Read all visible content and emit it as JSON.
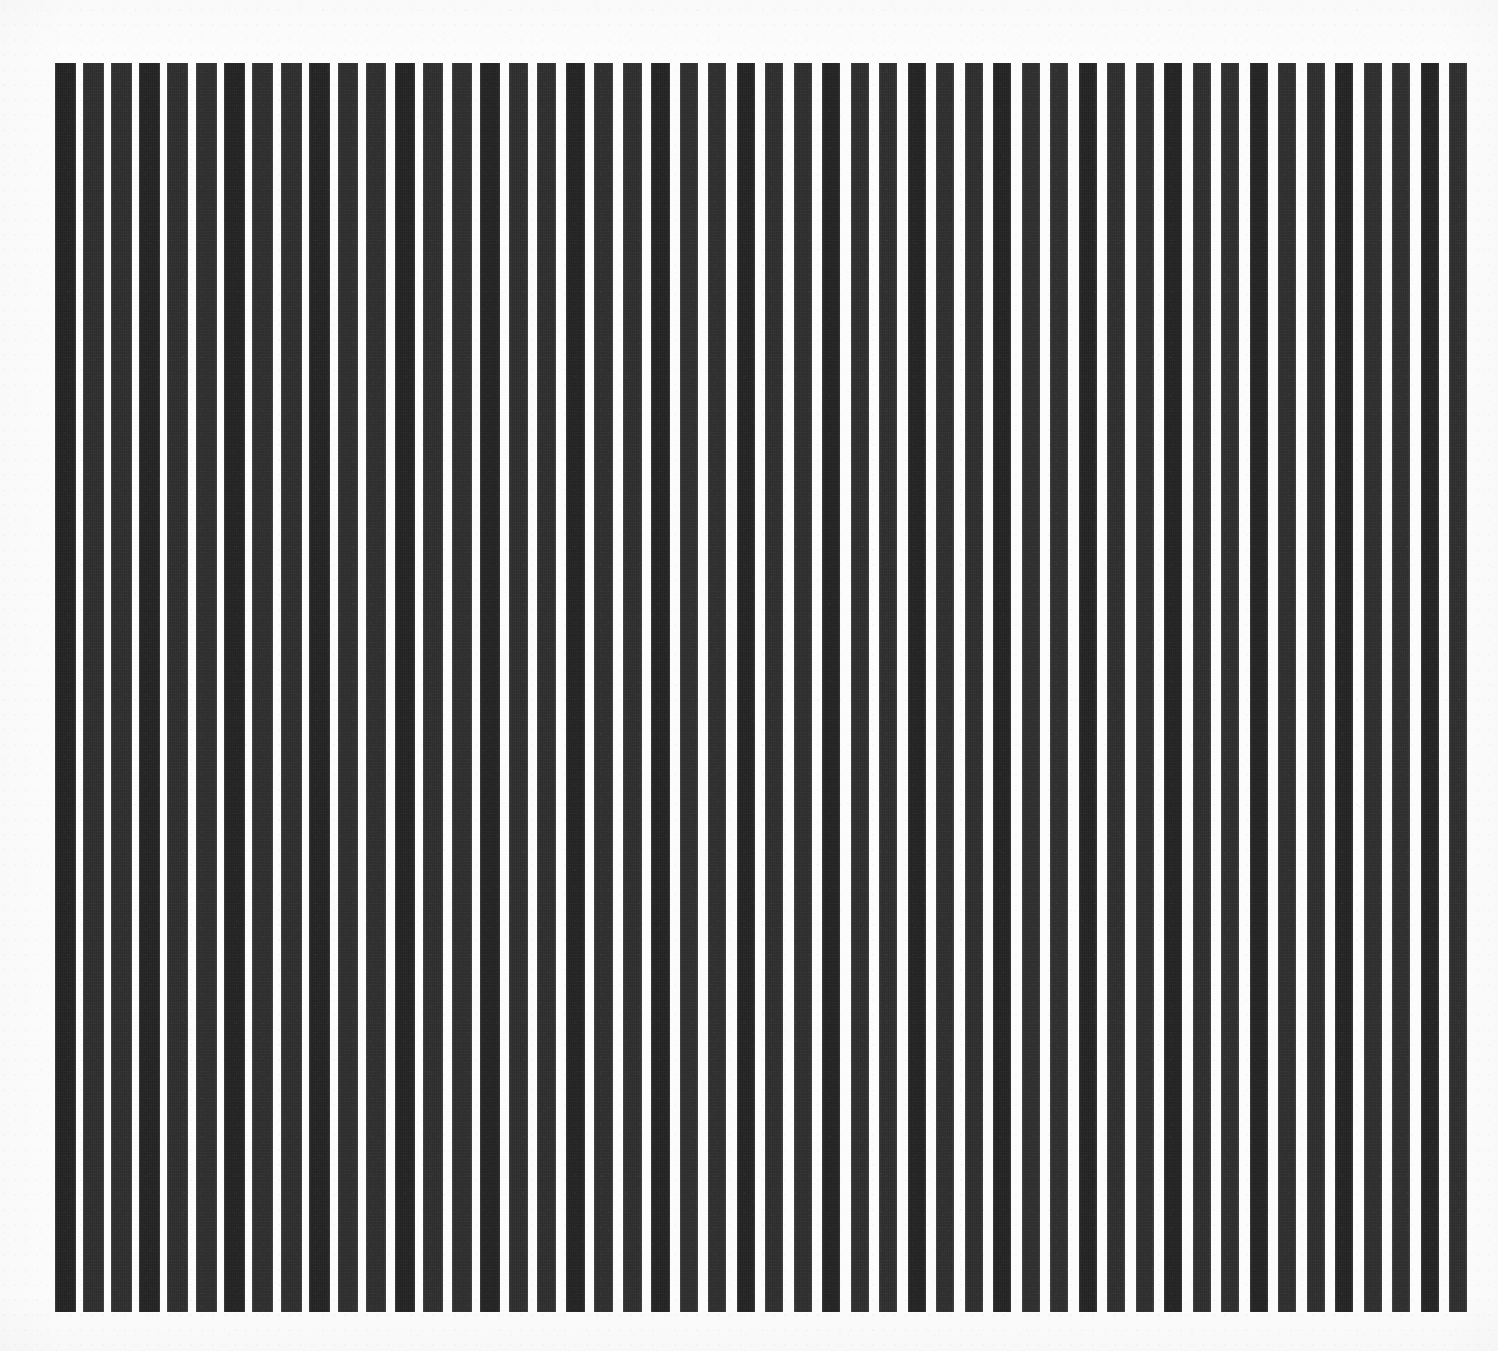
{
  "artwork": {
    "kind": "op-art-vertical-stripe-composition",
    "medium_appearance": "screenprint on white paper",
    "canvas_width": 1498,
    "canvas_height": 1351,
    "alt_text": "Op art composition of fifty vertical dark charcoal bars of slightly varying width and spacing on an off-white paper ground.",
    "colors": {
      "paper": "#fcfcfc",
      "page_background": "#ffffff",
      "ink": "#2f2f2f",
      "ink_shadow": "#242424"
    },
    "plate": {
      "left": 55,
      "top": 63,
      "right": 1478,
      "bottom": 1312,
      "width": 1423,
      "height": 1249
    },
    "stripe_count": 50,
    "stripe_metrics": {
      "min_width": 16,
      "max_width": 22,
      "min_gap": 6,
      "max_gap": 12,
      "mean_period": 28.5,
      "orientation": "vertical"
    },
    "stripes": [
      {
        "x": 55,
        "w": 21
      },
      {
        "x": 83,
        "w": 21
      },
      {
        "x": 111,
        "w": 21
      },
      {
        "x": 139,
        "w": 21
      },
      {
        "x": 167,
        "w": 21
      },
      {
        "x": 196,
        "w": 21
      },
      {
        "x": 224,
        "w": 21
      },
      {
        "x": 252,
        "w": 21
      },
      {
        "x": 281,
        "w": 21
      },
      {
        "x": 309,
        "w": 21
      },
      {
        "x": 338,
        "w": 20
      },
      {
        "x": 366,
        "w": 20
      },
      {
        "x": 395,
        "w": 20
      },
      {
        "x": 423,
        "w": 20
      },
      {
        "x": 452,
        "w": 20
      },
      {
        "x": 480,
        "w": 20
      },
      {
        "x": 509,
        "w": 19
      },
      {
        "x": 537,
        "w": 19
      },
      {
        "x": 566,
        "w": 19
      },
      {
        "x": 594,
        "w": 19
      },
      {
        "x": 623,
        "w": 19
      },
      {
        "x": 651,
        "w": 19
      },
      {
        "x": 680,
        "w": 18
      },
      {
        "x": 708,
        "w": 18
      },
      {
        "x": 737,
        "w": 18
      },
      {
        "x": 765,
        "w": 18
      },
      {
        "x": 794,
        "w": 18
      },
      {
        "x": 822,
        "w": 18
      },
      {
        "x": 851,
        "w": 18
      },
      {
        "x": 879,
        "w": 18
      },
      {
        "x": 908,
        "w": 18
      },
      {
        "x": 936,
        "w": 18
      },
      {
        "x": 965,
        "w": 18
      },
      {
        "x": 993,
        "w": 18
      },
      {
        "x": 1022,
        "w": 18
      },
      {
        "x": 1050,
        "w": 18
      },
      {
        "x": 1079,
        "w": 18
      },
      {
        "x": 1107,
        "w": 18
      },
      {
        "x": 1136,
        "w": 18
      },
      {
        "x": 1164,
        "w": 18
      },
      {
        "x": 1193,
        "w": 18
      },
      {
        "x": 1221,
        "w": 18
      },
      {
        "x": 1250,
        "w": 18
      },
      {
        "x": 1278,
        "w": 18
      },
      {
        "x": 1307,
        "w": 18
      },
      {
        "x": 1335,
        "w": 18
      },
      {
        "x": 1364,
        "w": 18
      },
      {
        "x": 1392,
        "w": 18
      },
      {
        "x": 1421,
        "w": 18
      },
      {
        "x": 1449,
        "w": 18
      }
    ]
  },
  "chart_data": {
    "type": "bar",
    "title": "",
    "subtitle": "",
    "xlabel": "",
    "ylabel": "",
    "grid": false,
    "legend": null,
    "orientation": "vertical",
    "categories": [
      "1",
      "2",
      "3",
      "4",
      "5",
      "6",
      "7",
      "8",
      "9",
      "10",
      "11",
      "12",
      "13",
      "14",
      "15",
      "16",
      "17",
      "18",
      "19",
      "20",
      "21",
      "22",
      "23",
      "24",
      "25",
      "26",
      "27",
      "28",
      "29",
      "30",
      "31",
      "32",
      "33",
      "34",
      "35",
      "36",
      "37",
      "38",
      "39",
      "40",
      "41",
      "42",
      "43",
      "44",
      "45",
      "46",
      "47",
      "48",
      "49",
      "50"
    ],
    "series": [
      {
        "name": "bar width (px)",
        "values": [
          21,
          21,
          21,
          21,
          21,
          21,
          21,
          21,
          21,
          21,
          20,
          20,
          20,
          20,
          20,
          20,
          19,
          19,
          19,
          19,
          19,
          19,
          18,
          18,
          18,
          18,
          18,
          18,
          18,
          18,
          18,
          18,
          18,
          18,
          18,
          18,
          18,
          18,
          18,
          18,
          18,
          18,
          18,
          18,
          18,
          18,
          18,
          18,
          18,
          18
        ]
      },
      {
        "name": "bar height (px)",
        "values": [
          1249,
          1249,
          1249,
          1249,
          1249,
          1249,
          1249,
          1249,
          1249,
          1249,
          1249,
          1249,
          1249,
          1249,
          1249,
          1249,
          1249,
          1249,
          1249,
          1249,
          1249,
          1249,
          1249,
          1249,
          1249,
          1249,
          1249,
          1249,
          1249,
          1249,
          1249,
          1249,
          1249,
          1249,
          1249,
          1249,
          1249,
          1249,
          1249,
          1249,
          1249,
          1249,
          1249,
          1249,
          1249,
          1249,
          1249,
          1249,
          1249,
          1249
        ]
      },
      {
        "name": "gap to next bar (px)",
        "values": [
          7,
          7,
          7,
          7,
          8,
          7,
          7,
          8,
          7,
          8,
          8,
          9,
          8,
          9,
          8,
          9,
          9,
          10,
          9,
          10,
          9,
          10,
          10,
          11,
          10,
          11,
          10,
          11,
          10,
          11,
          10,
          11,
          10,
          11,
          10,
          11,
          10,
          11,
          10,
          11,
          10,
          11,
          10,
          11,
          10,
          11,
          10,
          11,
          10,
          0
        ]
      }
    ],
    "xlim": [
      55,
      1478
    ],
    "ylim": [
      63,
      1312
    ]
  }
}
